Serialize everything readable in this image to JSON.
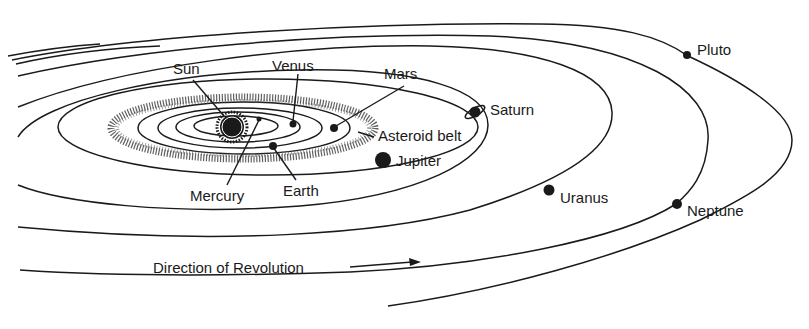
{
  "diagram": {
    "labels": {
      "sun": "Sun",
      "venus": "Venus",
      "mars": "Mars",
      "saturn": "Saturn",
      "asteroid_belt": "Asteroid belt",
      "jupiter": "Jupiter",
      "mercury": "Mercury",
      "earth": "Earth",
      "uranus": "Uranus",
      "neptune": "Neptune",
      "pluto": "Pluto",
      "direction": "Direction of Revolution"
    },
    "colors": {
      "ink": "#1a1a1a",
      "background": "#ffffff"
    }
  }
}
